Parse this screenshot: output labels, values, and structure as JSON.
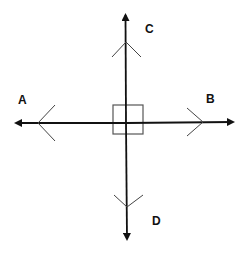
{
  "diagram": {
    "title": "",
    "labels": {
      "a": "A",
      "b": "B",
      "c": "C",
      "d": "D"
    },
    "colors": {
      "line": "#111111",
      "chevron": "#444444",
      "marker": "#555555",
      "background": "#ffffff"
    },
    "rays": [
      {
        "name": "A",
        "direction": "left"
      },
      {
        "name": "B",
        "direction": "right"
      },
      {
        "name": "C",
        "direction": "up"
      },
      {
        "name": "D",
        "direction": "down"
      }
    ],
    "right_angle_marker": true
  }
}
